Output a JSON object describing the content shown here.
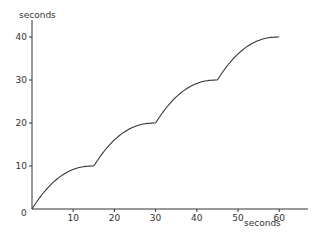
{
  "chart_data": {
    "type": "line",
    "title": "",
    "xlabel": "seconds",
    "ylabel": "seconds",
    "xlim": [
      0,
      67
    ],
    "ylim": [
      0,
      44
    ],
    "grid": false,
    "legend": null,
    "x_ticks": [
      0,
      10,
      20,
      30,
      40,
      50,
      60
    ],
    "y_ticks": [
      10,
      20,
      30,
      40
    ],
    "origin_label": "0",
    "series": [
      {
        "name": "curve",
        "segments": [
          {
            "x": [
              0,
              3,
              6,
              9,
              12,
              15
            ],
            "y": [
              0,
              4.4,
              7.0,
              8.6,
              9.6,
              10
            ]
          },
          {
            "x": [
              15,
              18,
              21,
              24,
              27,
              30
            ],
            "y": [
              10,
              14.4,
              17.0,
              18.6,
              19.6,
              20
            ]
          },
          {
            "x": [
              30,
              33,
              36,
              39,
              42,
              45
            ],
            "y": [
              20,
              24.4,
              27.0,
              28.6,
              29.6,
              30
            ]
          },
          {
            "x": [
              45,
              48,
              51,
              54,
              57,
              60
            ],
            "y": [
              30,
              34.4,
              37.0,
              38.6,
              39.6,
              40
            ]
          }
        ]
      }
    ]
  },
  "colors": {
    "axis": "#333333",
    "curve": "#333333",
    "background": "#ffffff"
  }
}
